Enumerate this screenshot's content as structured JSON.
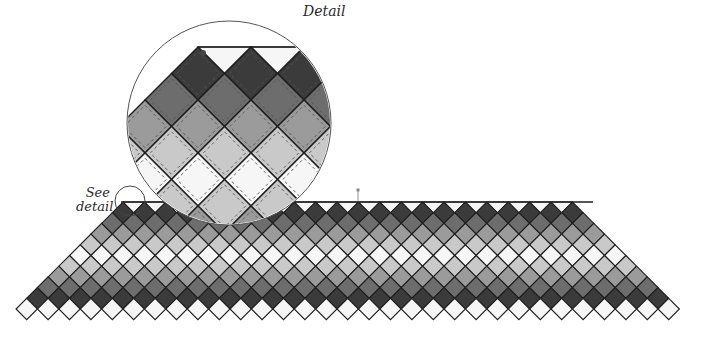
{
  "labels": {
    "detail": "Detail",
    "see_detail_line1": "See",
    "see_detail_line2": "detail"
  },
  "palette": {
    "white": "#f6f6f6",
    "light": "#c9c9c9",
    "medium": "#9b9b9b",
    "medium_dark": "#6d6d6d",
    "dark": "#3b3b3b",
    "outline": "#1e1e1e",
    "stitch": "#555555"
  },
  "quilt": {
    "top_y": 202,
    "top_left_x": 121,
    "top_right_x": 593,
    "bottom_left_x": 16,
    "bottom_right_x": 700,
    "diamond_width": 21.4,
    "row_shades": [
      "white-half",
      "dark",
      "medium_dark",
      "medium",
      "light",
      "white",
      "light",
      "medium",
      "medium_dark",
      "dark",
      "white"
    ],
    "bottom_row_count": 32
  },
  "marker": {
    "x": 358,
    "y": 190
  },
  "small_circle": {
    "cx": 130,
    "cy": 201,
    "r": 15
  },
  "detail_circle": {
    "cx": 229,
    "cy": 123,
    "r": 102,
    "top_y": 47,
    "start_x": 198,
    "diamond_width": 53
  }
}
